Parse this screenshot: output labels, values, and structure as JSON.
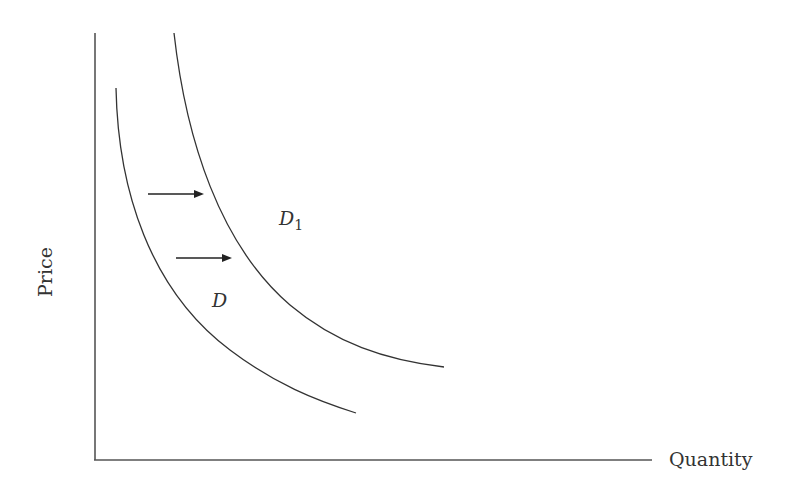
{
  "diagram": {
    "type": "demand-shift",
    "axes": {
      "y_label": "Price",
      "x_label": "Quantity"
    },
    "curves": [
      {
        "id": "D",
        "label": "D",
        "subscript": "",
        "description": "original demand curve"
      },
      {
        "id": "D1",
        "label": "D",
        "subscript": "1",
        "description": "shifted demand curve (rightward)"
      }
    ],
    "arrows": [
      {
        "direction": "right",
        "meaning": "demand shift"
      },
      {
        "direction": "right",
        "meaning": "demand shift"
      }
    ],
    "colors": {
      "line": "#333333",
      "axis": "#555555",
      "background": "#ffffff"
    }
  }
}
